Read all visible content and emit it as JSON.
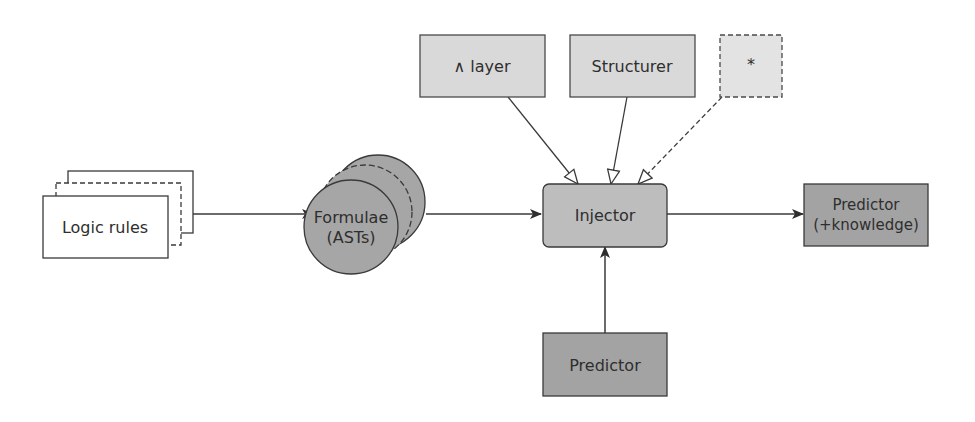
{
  "diagram": {
    "nodes": {
      "logic_rules": {
        "label": "Logic rules",
        "fill": "#ffffff"
      },
      "formulae": {
        "line1": "Formulae",
        "line2": "(ASTs)",
        "fill": "#a6a6a6"
      },
      "and_layer": {
        "label": "∧ layer",
        "fill": "#d9d9d9"
      },
      "structurer": {
        "label": "Structurer",
        "fill": "#d9d9d9"
      },
      "star": {
        "label": "*",
        "fill": "#e3e3e3"
      },
      "injector": {
        "label": "Injector",
        "fill": "#bdbdbd"
      },
      "predictor": {
        "label": "Predictor",
        "fill": "#a3a3a3"
      },
      "predictor_knowledge": {
        "line1": "Predictor",
        "line2": "(+knowledge)",
        "fill": "#a3a3a3"
      }
    },
    "edges": [
      {
        "from": "logic_rules",
        "to": "formulae",
        "style": "solid",
        "head": "filled"
      },
      {
        "from": "formulae",
        "to": "injector",
        "style": "solid",
        "head": "filled"
      },
      {
        "from": "and_layer",
        "to": "injector",
        "style": "solid",
        "head": "hollow"
      },
      {
        "from": "structurer",
        "to": "injector",
        "style": "solid",
        "head": "hollow"
      },
      {
        "from": "star",
        "to": "injector",
        "style": "dashed",
        "head": "hollow"
      },
      {
        "from": "predictor",
        "to": "injector",
        "style": "solid",
        "head": "filled"
      },
      {
        "from": "injector",
        "to": "predictor_knowledge",
        "style": "solid",
        "head": "filled"
      }
    ]
  }
}
